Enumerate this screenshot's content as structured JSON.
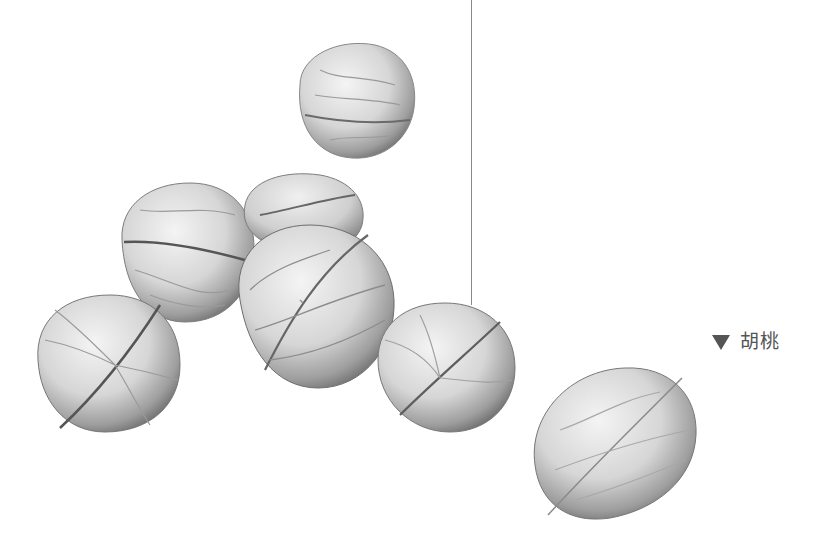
{
  "figure": {
    "walnut_count": 7,
    "label": {
      "marker": "▼",
      "text": "胡桃",
      "color": "#555555"
    },
    "pointer_line_color": "#8a8a8a",
    "background": "#ffffff"
  }
}
